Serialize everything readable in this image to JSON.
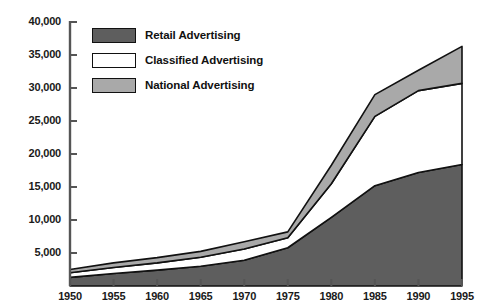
{
  "chart_data": {
    "type": "area",
    "title": "",
    "subtitle": "",
    "xlabel": "",
    "ylabel": "",
    "stacked": true,
    "grid": false,
    "legend_position": "top-left",
    "x": [
      1950,
      1955,
      1960,
      1965,
      1970,
      1975,
      1980,
      1985,
      1990,
      1995
    ],
    "xlim": [
      1950,
      1995
    ],
    "ylim": [
      0,
      40000
    ],
    "xticks": [
      "1950",
      "1955",
      "1960",
      "1965",
      "1970",
      "1975",
      "1980",
      "1985",
      "1990",
      "1995"
    ],
    "yticks": [
      "5,000",
      "10,000",
      "15,000",
      "20,000",
      "25,000",
      "30,000",
      "35,000",
      "40,000"
    ],
    "ytick_values": [
      5000,
      10000,
      15000,
      20000,
      25000,
      30000,
      35000,
      40000
    ],
    "series": [
      {
        "name": "Retail Advertising",
        "color": "#5e5e5e",
        "values": [
          1300,
          1900,
          2400,
          3000,
          3900,
          5800,
          10400,
          15200,
          17200,
          18400
        ]
      },
      {
        "name": "Classified Advertising",
        "color": "#ffffff",
        "values": [
          700,
          900,
          1100,
          1350,
          1700,
          1500,
          5100,
          10500,
          12400,
          12300
        ]
      },
      {
        "name": "National Advertising",
        "color": "#a9a9a9",
        "values": [
          500,
          700,
          800,
          900,
          1100,
          900,
          2800,
          3300,
          3100,
          5600
        ]
      }
    ],
    "totals": [
      2500,
      3500,
      4300,
      5250,
      6700,
      8200,
      18300,
      29000,
      32700,
      36300
    ]
  },
  "legend": {
    "items": [
      {
        "label": "Retail Advertising",
        "color": "#5e5e5e"
      },
      {
        "label": "Classified Advertising",
        "color": "#ffffff"
      },
      {
        "label": "National Advertising",
        "color": "#a9a9a9"
      }
    ]
  },
  "axis": {
    "line_color": "#555555"
  }
}
